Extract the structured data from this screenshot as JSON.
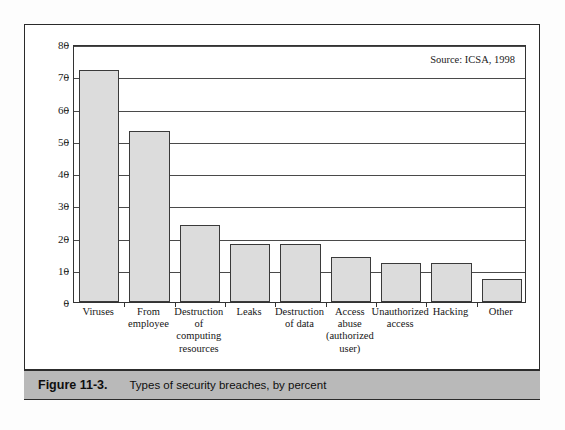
{
  "figure": {
    "caption_number": "Figure 11-3.",
    "caption_text": "Types of security breaches, by percent",
    "source_note": "Source: ICSA, 1998"
  },
  "chart_data": {
    "type": "bar",
    "title": "",
    "subtitle": "",
    "xlabel": "",
    "ylabel": "",
    "ylim": [
      0,
      80
    ],
    "yticks": [
      0,
      10,
      20,
      30,
      40,
      50,
      60,
      70,
      80
    ],
    "ytick_labels": [
      "0",
      "10",
      "20",
      "30",
      "40",
      "50",
      "60",
      "70",
      "80"
    ],
    "grid": true,
    "grid_axis": "y",
    "legend": false,
    "annotations": [
      "Source: ICSA, 1998"
    ],
    "bar_fill_color": "#dcdcdc",
    "bar_edge_color": "#3a3a3a",
    "categories": [
      "Viruses",
      "From employee",
      "Destruction of computing resources",
      "Leaks",
      "Destruction of data",
      "Access abuse (authorized user)",
      "Unauthorized access",
      "Hacking",
      "Other"
    ],
    "category_lines": [
      [
        "Viruses"
      ],
      [
        "From",
        "employee"
      ],
      [
        "Destruction",
        "of",
        "computing",
        "resources"
      ],
      [
        "Leaks"
      ],
      [
        "Destruction",
        "of data"
      ],
      [
        "Access",
        "abuse",
        "(authorized",
        "user)"
      ],
      [
        "Unauthorized",
        "access"
      ],
      [
        "Hacking"
      ],
      [
        "Other"
      ]
    ],
    "values": [
      72,
      53,
      24,
      18,
      18,
      14,
      12,
      12,
      7
    ],
    "units": "percent"
  }
}
